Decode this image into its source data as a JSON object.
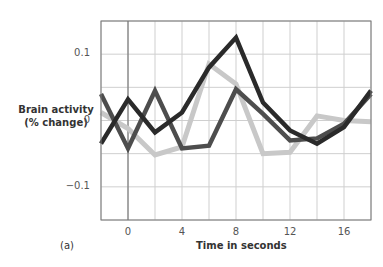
{
  "chart_data": {
    "type": "line",
    "title": "",
    "panel_label": "(a)",
    "xlabel": "Time in seconds",
    "ylabel_line1": "Brain activity",
    "ylabel_line2": "(% change)",
    "xlim": [
      -2,
      18
    ],
    "ylim": [
      -0.15,
      0.15
    ],
    "grid": true,
    "x_gridlines": [
      -2,
      0,
      2,
      4,
      6,
      8,
      10,
      12,
      14,
      16,
      18
    ],
    "y_gridlines": [
      -0.15,
      -0.1,
      -0.05,
      0,
      0.05,
      0.1,
      0.15
    ],
    "x_tick_labels": [
      "0",
      "4",
      "8",
      "12",
      "16"
    ],
    "x_tick_values": [
      0,
      4,
      8,
      12,
      16
    ],
    "y_tick_labels": [
      "0.1",
      "0",
      "−0.1"
    ],
    "y_tick_values": [
      0.1,
      0,
      -0.1
    ],
    "x": [
      -2,
      0,
      2,
      4,
      6,
      8,
      10,
      12,
      14,
      16,
      18
    ],
    "series": [
      {
        "name": "dark series",
        "color": "#2a2a2a",
        "values": [
          -0.035,
          0.032,
          -0.018,
          0.012,
          0.08,
          0.125,
          0.027,
          -0.015,
          -0.035,
          -0.01,
          0.045
        ]
      },
      {
        "name": "medium series",
        "color": "#4d4d4d",
        "values": [
          0.04,
          -0.042,
          0.045,
          -0.042,
          -0.038,
          0.047,
          0.01,
          -0.03,
          -0.027,
          -0.005,
          0.04
        ]
      },
      {
        "name": "light series",
        "color": "#c8c8c8",
        "values": [
          0.012,
          -0.012,
          -0.052,
          -0.04,
          0.085,
          0.055,
          -0.05,
          -0.048,
          0.007,
          0.0,
          -0.002
        ]
      }
    ],
    "legend": "none"
  }
}
